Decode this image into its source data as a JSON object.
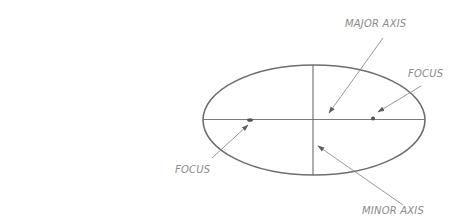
{
  "diagram": {
    "title": "",
    "labels": {
      "major_axis": "MAJOR AXIS",
      "focus_right": "FOCUS",
      "focus_left": "FOCUS",
      "minor_axis": "MINOR AXIS"
    },
    "colors": {
      "stroke": "#6e6e6e",
      "leader": "#8c8c8c",
      "text": "#8a8a8a",
      "background": "#ffffff"
    },
    "geometry": {
      "ellipse": {
        "cx": 314,
        "cy": 120,
        "rx": 111,
        "ry": 55
      },
      "major_axis_line": {
        "x1": 203,
        "y1": 119.5,
        "x2": 425,
        "y2": 119.5
      },
      "minor_axis_line": {
        "x1": 313,
        "y1": 65,
        "x2": 313,
        "y2": 175
      },
      "foci": [
        {
          "x": 250,
          "y": 120
        },
        {
          "x": 373,
          "y": 118.5
        }
      ],
      "arrows": [
        {
          "name": "major-axis-arrow",
          "x1": 383,
          "y1": 38,
          "x2": 329,
          "y2": 113
        },
        {
          "name": "focus-right-arrow",
          "x1": 421,
          "y1": 86,
          "x2": 378,
          "y2": 112
        },
        {
          "name": "minor-axis-arrow",
          "x1": 403,
          "y1": 205,
          "x2": 318,
          "y2": 146
        },
        {
          "name": "focus-left-arrow",
          "x1": 212,
          "y1": 158,
          "x2": 248,
          "y2": 125
        }
      ]
    }
  }
}
